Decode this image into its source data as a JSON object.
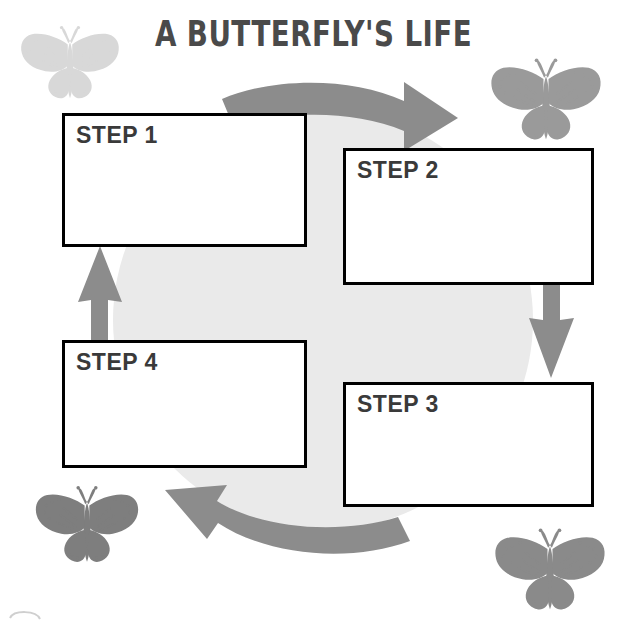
{
  "page": {
    "title": "A Butterfly's Life",
    "title_display": "A BUTTERFLY'S LIFE",
    "background_color": "#ffffff",
    "circle_color": "#eaeaea",
    "arrow_color": "#8c8c8c",
    "box_border_color": "#000000",
    "label_color": "#3a3a3a",
    "title_color": "#4a4a4a"
  },
  "steps": [
    {
      "id": "step-1",
      "label": "STEP 1",
      "content": ""
    },
    {
      "id": "step-2",
      "label": "STEP 2",
      "content": ""
    },
    {
      "id": "step-3",
      "label": "STEP 3",
      "content": ""
    },
    {
      "id": "step-4",
      "label": "STEP 4",
      "content": ""
    }
  ],
  "arrows": [
    {
      "id": "arrow-top",
      "name": "arrow-step1-to-step2",
      "shape": "curved",
      "direction": "clockwise-right",
      "color": "#8c8c8c"
    },
    {
      "id": "arrow-right",
      "name": "arrow-step2-to-step3",
      "shape": "straight",
      "direction": "down",
      "color": "#8c8c8c"
    },
    {
      "id": "arrow-bottom",
      "name": "arrow-step3-to-step4",
      "shape": "curved",
      "direction": "clockwise-left",
      "color": "#8c8c8c"
    },
    {
      "id": "arrow-left",
      "name": "arrow-step4-to-step1",
      "shape": "straight",
      "direction": "up",
      "color": "#8c8c8c"
    }
  ],
  "decorations": [
    {
      "id": "butterfly-top-left",
      "name": "monarch-butterfly-icon",
      "color": "#d7d7d7"
    },
    {
      "id": "butterfly-top-right",
      "name": "monarch-butterfly-icon",
      "color": "#9a9a9a"
    },
    {
      "id": "butterfly-bottom-left",
      "name": "monarch-butterfly-icon",
      "color": "#7e7e7e"
    },
    {
      "id": "butterfly-bottom-right",
      "name": "monarch-butterfly-icon",
      "color": "#8a8a8a"
    }
  ]
}
